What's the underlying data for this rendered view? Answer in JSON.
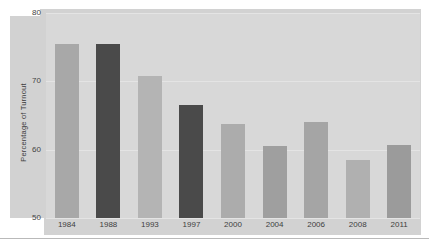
{
  "chart_data": {
    "type": "bar",
    "title": "",
    "subtitle": "",
    "xlabel": "",
    "ylabel": "Percentage of Turnout",
    "categories": [
      "1984",
      "1988",
      "1993",
      "1997",
      "2000",
      "2004",
      "2006",
      "2008",
      "2011"
    ],
    "values": [
      75.5,
      75.5,
      70.8,
      66.5,
      63.8,
      60.5,
      64.0,
      58.5,
      60.7
    ],
    "bar_colors": [
      "#a8a8a8",
      "#4a4a4a",
      "#b4b4b4",
      "#4a4a4a",
      "#acacac",
      "#9f9f9f",
      "#a5a5a5",
      "#b0b0b0",
      "#9b9b9b"
    ],
    "ylim": [
      50,
      80
    ],
    "yticks": [
      "80",
      "70",
      "60",
      "50"
    ],
    "ytick_values": [
      80,
      70,
      60,
      50
    ],
    "grid": true,
    "legend": "none",
    "plot_background": "#d8d8d8",
    "figure_background": "#d2d2d2",
    "page_background": "#ffffff"
  },
  "figure": {
    "y_axis_label": "Percentage of Turnout"
  }
}
